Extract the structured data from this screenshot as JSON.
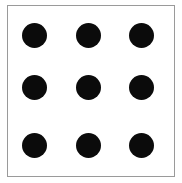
{
  "figure": {
    "name": "nine-dot-grid",
    "background_color": "#ffffff",
    "frame": {
      "x": 7,
      "y": 5,
      "width": 168,
      "height": 172,
      "border_color": "#9a9a9a",
      "border_width": 1.5,
      "fill_color": "#ffffff"
    },
    "dots": {
      "color": "#0b0b0b",
      "diameter": 25,
      "rows": 3,
      "columns": 3,
      "centers_x": [
        34,
        88,
        141
      ],
      "centers_y": [
        35,
        87,
        145
      ]
    }
  }
}
